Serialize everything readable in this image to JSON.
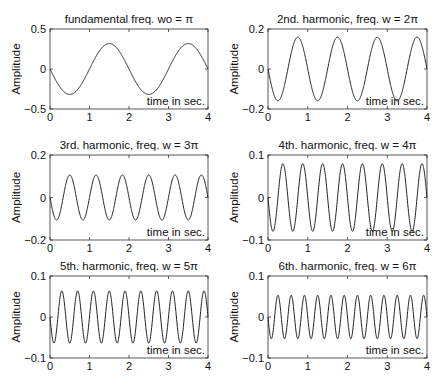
{
  "figure": {
    "width": 443,
    "height": 386,
    "line_color": "#222222",
    "axis_color": "#333333"
  },
  "chart_data": [
    {
      "type": "line",
      "title": "fundamental freq. wo = π",
      "xlabel": "time in sec.",
      "ylabel": "Amplitude",
      "xlim": [
        0,
        4
      ],
      "ylim": [
        -0.5,
        0.5
      ],
      "xticks": [
        "0",
        "1",
        "2",
        "3",
        "4"
      ],
      "yticks": [
        "-0.5",
        "0",
        "0.5"
      ],
      "ytick_values": [
        -0.5,
        0,
        0.5
      ],
      "harmonic": 1,
      "amplitude": 0.318,
      "formula": "y = -(1/(1·π))·sin(1·π·t)",
      "box": [
        50,
        29,
        208,
        109
      ]
    },
    {
      "type": "line",
      "title": "2nd. harmonic, freq. w = 2π",
      "xlabel": "time in sec.",
      "ylabel": "Amplitude",
      "xlim": [
        0,
        4
      ],
      "ylim": [
        -0.2,
        0.2
      ],
      "xticks": [
        "0",
        "1",
        "2",
        "3",
        "4"
      ],
      "yticks": [
        "-0.2",
        "0",
        "0.2"
      ],
      "ytick_values": [
        -0.2,
        0,
        0.2
      ],
      "harmonic": 2,
      "amplitude": 0.159,
      "formula": "y = -(1/(2·π))·sin(2·π·t)",
      "box": [
        268,
        29,
        427,
        109
      ]
    },
    {
      "type": "line",
      "title": "3rd. harmonic, freq. w = 3π",
      "xlabel": "time in sec.",
      "ylabel": "Amplitude",
      "xlim": [
        0,
        4
      ],
      "ylim": [
        -0.2,
        0.2
      ],
      "xticks": [
        "0",
        "1",
        "2",
        "3",
        "4"
      ],
      "yticks": [
        "-0.2",
        "0",
        "0.2"
      ],
      "ytick_values": [
        -0.2,
        0,
        0.2
      ],
      "harmonic": 3,
      "amplitude": 0.106,
      "formula": "y = -(1/(3·π))·sin(3·π·t)",
      "box": [
        50,
        155,
        208,
        240
      ]
    },
    {
      "type": "line",
      "title": "4th. harmonic, freq. w = 4π",
      "xlabel": "time in sec.",
      "ylabel": "Amplitude",
      "xlim": [
        0,
        4
      ],
      "ylim": [
        -0.1,
        0.1
      ],
      "xticks": [
        "0",
        "1",
        "2",
        "3",
        "4"
      ],
      "yticks": [
        "-0.1",
        "0",
        "0.1"
      ],
      "ytick_values": [
        -0.1,
        0,
        0.1
      ],
      "harmonic": 4,
      "amplitude": 0.0796,
      "formula": "y = -(1/(4·π))·sin(4·π·t)",
      "box": [
        268,
        155,
        427,
        240
      ]
    },
    {
      "type": "line",
      "title": "5th. harmonic, freq. w = 5π",
      "xlabel": "time in sec.",
      "ylabel": "Amplitude",
      "xlim": [
        0,
        4
      ],
      "ylim": [
        -0.1,
        0.1
      ],
      "xticks": [
        "0",
        "1",
        "2",
        "3",
        "4"
      ],
      "yticks": [
        "-0.1",
        "0",
        "0.1"
      ],
      "ytick_values": [
        -0.1,
        0,
        0.1
      ],
      "harmonic": 5,
      "amplitude": 0.0637,
      "formula": "y = -(1/(5·π))·sin(5·π·t)",
      "box": [
        50,
        276,
        208,
        358
      ]
    },
    {
      "type": "line",
      "title": "6th. harmonic, freq. w = 6π",
      "xlabel": "time in sec.",
      "ylabel": "Amplitude",
      "xlim": [
        0,
        4
      ],
      "ylim": [
        -0.1,
        0.1
      ],
      "xticks": [
        "0",
        "1",
        "2",
        "3",
        "4"
      ],
      "yticks": [
        "-0.1",
        "0",
        "0.1"
      ],
      "ytick_values": [
        -0.1,
        0,
        0.1
      ],
      "harmonic": 6,
      "amplitude": 0.0531,
      "formula": "y = -(1/(6·π))·sin(6·π·t)",
      "box": [
        268,
        276,
        427,
        358
      ]
    }
  ]
}
